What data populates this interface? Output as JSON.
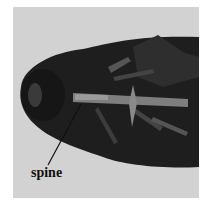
{
  "figure": {
    "annotation": {
      "label": "spine"
    },
    "colors": {
      "background": "#d2d2d2",
      "body": "#1e1e1e",
      "highlight": "#9a9a9a"
    }
  }
}
